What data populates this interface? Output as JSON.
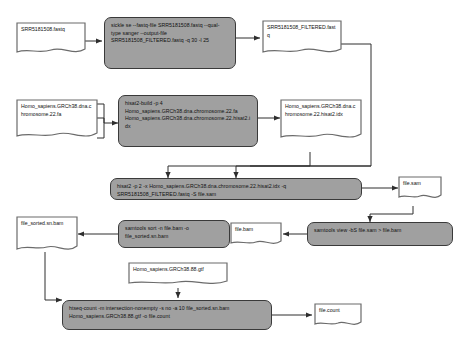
{
  "diagram": {
    "colors": {
      "process_fill": "#a0a0a0",
      "process_stroke": "#3a3a3a",
      "file_fill": "#ffffff",
      "file_stroke": "#6b6b6b",
      "edge": "#2e2e2e",
      "background": "#ffffff"
    },
    "nodes": {
      "input_fastq": {
        "type": "file",
        "text": "SRR5181508.fastq"
      },
      "sickle_cmd": {
        "type": "process",
        "text": "sickle se --fastq-file SRR5181508.fastq --qual-type sanger --output-file SRR5181508_FILTERED.fastq -q 30 -l 25"
      },
      "filtered_fastq": {
        "type": "file",
        "text": "SRR5181508_FILTERED.fastq"
      },
      "genome_fa": {
        "type": "file",
        "text": "Homo_sapiens.GRCh38.dna.chromosome.22.fa"
      },
      "hisat2_build_cmd": {
        "type": "process",
        "text": "hisat2-build -p 4 Homo_sapiens.GRCh38.dna.chromosome.22.fa Homo_sapiens.GRCh38.dna.chromosome.22.hisat2.idx"
      },
      "index_idx": {
        "type": "file",
        "text": "Homo_sapiens.GRCh38.dna.chromosome.22.hisat2.idx"
      },
      "hisat2_align_cmd": {
        "type": "process",
        "text": "hisat2 -p 2 -x Homo_sapiens.GRCh38.dna.chromosome.22.hisat2.idx -q SRR5181508_FILTERED.fastq -S file.sam"
      },
      "file_sam": {
        "type": "file",
        "text": "file.sam"
      },
      "samtools_view_cmd": {
        "type": "process",
        "text": "samtools view -bS file.sam > file.bam"
      },
      "file_bam": {
        "type": "file",
        "text": "file.bam"
      },
      "samtools_sort_cmd": {
        "type": "process",
        "text": "samtools sort -n file.bam -o file_sorted.sn.bam"
      },
      "file_sorted_bam": {
        "type": "file",
        "text": "file_sorted.sn.bam"
      },
      "annotation_gtf": {
        "type": "file",
        "text": "Homo_sapiens.GRCh38.88.gtf"
      },
      "htseq_count_cmd": {
        "type": "process",
        "text": "htseq-count -m intersection-nonempty -s no -a 10  file_sorted.sn.bam Homo_sapiens.GRCh38.88.gtf -o file.count"
      },
      "file_count": {
        "type": "file",
        "text": "file.count"
      }
    },
    "edges": [
      {
        "from": "input_fastq",
        "to": "sickle_cmd"
      },
      {
        "from": "sickle_cmd",
        "to": "filtered_fastq"
      },
      {
        "from": "filtered_fastq",
        "to": "hisat2_align_cmd"
      },
      {
        "from": "genome_fa",
        "to": "hisat2_build_cmd"
      },
      {
        "from": "hisat2_build_cmd",
        "to": "index_idx"
      },
      {
        "from": "index_idx",
        "to": "hisat2_align_cmd"
      },
      {
        "from": "hisat2_align_cmd",
        "to": "file_sam"
      },
      {
        "from": "file_sam",
        "to": "samtools_view_cmd"
      },
      {
        "from": "samtools_view_cmd",
        "to": "file_bam"
      },
      {
        "from": "file_bam",
        "to": "samtools_sort_cmd"
      },
      {
        "from": "samtools_sort_cmd",
        "to": "file_sorted_bam"
      },
      {
        "from": "file_sorted_bam",
        "to": "htseq_count_cmd"
      },
      {
        "from": "annotation_gtf",
        "to": "htseq_count_cmd"
      },
      {
        "from": "htseq_count_cmd",
        "to": "file_count"
      }
    ]
  }
}
